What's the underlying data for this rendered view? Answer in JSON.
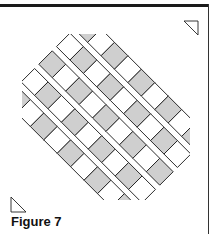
{
  "figure": {
    "caption": "Figure 7",
    "colors": {
      "gray_fill": "#cfcfcf",
      "white_fill": "#ffffff",
      "outline": "#222222",
      "border": "#1a1a1a"
    },
    "layout": {
      "center": [
        106,
        118
      ],
      "cell_size": 19,
      "gap": 6,
      "strip_count": 5,
      "cells_per_strip": 9
    }
  }
}
